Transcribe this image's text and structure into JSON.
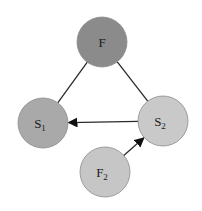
{
  "diagram": {
    "type": "graph",
    "background": "#ffffff",
    "nodes": [
      {
        "id": "F",
        "label": "F",
        "subscript": "",
        "cx": 102,
        "cy": 42,
        "r": 25,
        "fill": "#8b8b8b"
      },
      {
        "id": "S1",
        "label": "S",
        "subscript": "1",
        "cx": 43,
        "cy": 123,
        "r": 25,
        "fill": "#a9a9a9"
      },
      {
        "id": "S2",
        "label": "S",
        "subscript": "2",
        "cx": 163,
        "cy": 121,
        "r": 25,
        "fill": "#c9c9c9"
      },
      {
        "id": "F2",
        "label": "F",
        "subscript": "2",
        "cx": 105,
        "cy": 172,
        "r": 25,
        "fill": "#c6c6c6"
      }
    ],
    "edges": [
      {
        "from": "F",
        "to": "S1",
        "directed": false
      },
      {
        "from": "F",
        "to": "S2",
        "directed": false
      },
      {
        "from": "S2",
        "to": "S1",
        "directed": true
      },
      {
        "from": "F2",
        "to": "S2",
        "directed": true
      }
    ]
  }
}
